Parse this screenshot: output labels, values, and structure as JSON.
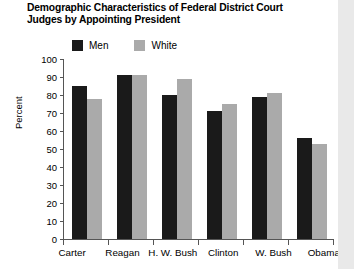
{
  "chart_data": {
    "type": "bar",
    "title": "Demographic Characteristics of Federal District Court\nJudges by Appointing President",
    "xlabel": "",
    "ylabel": "Percent",
    "ylim": [
      0,
      100
    ],
    "ytick_step": 10,
    "yticks": [
      100,
      90,
      80,
      70,
      60,
      50,
      40,
      30,
      20,
      10,
      0
    ],
    "grid": false,
    "legend_position": "top",
    "categories": [
      "Carter",
      "Reagan",
      "H. W. Bush",
      "Clinton",
      "W. Bush",
      "Obama"
    ],
    "series": [
      {
        "name": "Men",
        "color": "#1a1a1a",
        "values": [
          85,
          91,
          80,
          71,
          79,
          56
        ]
      },
      {
        "name": "White",
        "color": "#aaaaaa",
        "values": [
          78,
          91,
          89,
          75,
          81,
          53
        ]
      }
    ]
  },
  "colors": {
    "men": "#1a1a1a",
    "white": "#aaaaaa",
    "axis": "#555555",
    "background": "#ffffff",
    "right_strip": "#e9e9e9"
  }
}
